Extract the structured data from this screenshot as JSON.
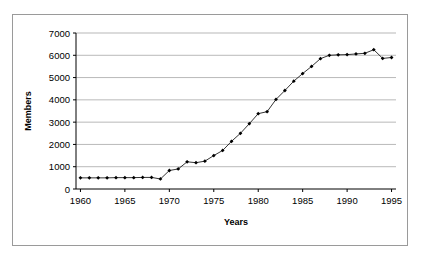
{
  "chart_data": {
    "type": "line",
    "title": "",
    "xlabel": "Years",
    "ylabel": "Members",
    "xlim": [
      1959.5,
      1995.5
    ],
    "ylim": [
      0,
      7000
    ],
    "grid": true,
    "legend": false,
    "marker": "diamond",
    "line_color": "#000000",
    "marker_color": "#000000",
    "gridline_color": "#9a9a9a",
    "background_color": "#ffffff",
    "frame_color": "#9a9a9a",
    "y_ticks": [
      0,
      1000,
      2000,
      3000,
      4000,
      5000,
      6000,
      7000
    ],
    "y_tick_labels": [
      "0",
      "1000",
      "2000",
      "3000",
      "4000",
      "5000",
      "6000",
      "7000"
    ],
    "x_ticks": [
      1960,
      1965,
      1970,
      1975,
      1980,
      1985,
      1990,
      1995
    ],
    "x_tick_labels": [
      "1960",
      "1965",
      "1970",
      "1975",
      "1980",
      "1985",
      "1990",
      "1995"
    ],
    "series": [
      {
        "name": "Members",
        "x": [
          1960,
          1961,
          1962,
          1963,
          1964,
          1965,
          1966,
          1967,
          1968,
          1969,
          1970,
          1971,
          1972,
          1973,
          1974,
          1975,
          1976,
          1977,
          1978,
          1979,
          1980,
          1981,
          1982,
          1983,
          1984,
          1985,
          1986,
          1987,
          1988,
          1989,
          1990,
          1991,
          1992,
          1993,
          1994,
          1995
        ],
        "values": [
          500,
          500,
          500,
          500,
          510,
          510,
          510,
          520,
          520,
          450,
          830,
          900,
          1220,
          1180,
          1250,
          1500,
          1730,
          2140,
          2500,
          2930,
          3380,
          3470,
          4020,
          4420,
          4840,
          5180,
          5500,
          5850,
          6000,
          6020,
          6030,
          6060,
          6090,
          6250,
          5860,
          5900
        ]
      }
    ]
  }
}
